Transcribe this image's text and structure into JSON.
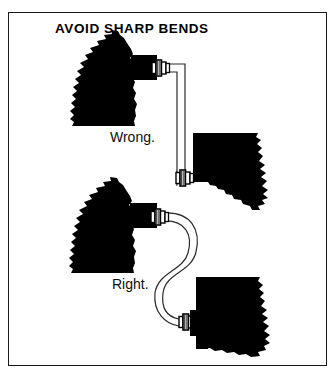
{
  "figure": {
    "title": "AVOID SHARP BENDS",
    "background_color": "#ffffff",
    "ink_color": "#000000",
    "border_color": "#1a1a1a"
  },
  "labels": {
    "wrong": "Wrong.",
    "right": "Right."
  },
  "diagram": {
    "type": "technical-line-illustration",
    "panels": [
      {
        "id": "upper",
        "verdict": "Wrong.",
        "tube_routing": "sharp right-angle bends",
        "description": "Tube leaves the upper-left block horizontally, turns a hard 90 degrees downward, runs straight down, then turns a hard 90 degrees to enter the lower-right block."
      },
      {
        "id": "lower",
        "verdict": "Right.",
        "tube_routing": "smooth sweeping S-curve",
        "description": "Tube leaves the left block and sweeps in a gentle S-shaped curve down to the lower-right block with no kinks."
      }
    ],
    "fittings": {
      "count": 4,
      "name": "hex union coupling",
      "description": "Small hex nut / union fitting where each tube end joins a block."
    },
    "blocks": {
      "count": 4,
      "fill": "solid black",
      "edge_style": "ragged torn-away section edge"
    }
  }
}
